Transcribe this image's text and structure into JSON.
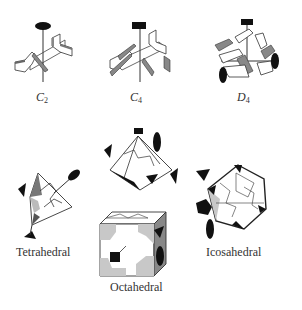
{
  "figure": {
    "panels": [
      {
        "id": "c2",
        "symbol": "C",
        "subscript": "2",
        "kind": "cyclic"
      },
      {
        "id": "c4",
        "symbol": "C",
        "subscript": "4",
        "kind": "cyclic"
      },
      {
        "id": "d4",
        "symbol": "D",
        "subscript": "4",
        "kind": "dihedral"
      },
      {
        "id": "tetrahedral",
        "label": "Tetrahedral",
        "kind": "cubic"
      },
      {
        "id": "octahedral",
        "label": "Octahedral",
        "kind": "cubic"
      },
      {
        "id": "icosahedral",
        "label": "Icosahedral",
        "kind": "cubic"
      }
    ]
  },
  "colors": {
    "background": "#ffffff",
    "line": "#333333",
    "subunit_face": "#ffffff",
    "subunit_side": "#8a8a8a",
    "face_shade": "#c8c8c8",
    "dark_face": "#7a7a7a",
    "axis_symbol": "#111111"
  }
}
